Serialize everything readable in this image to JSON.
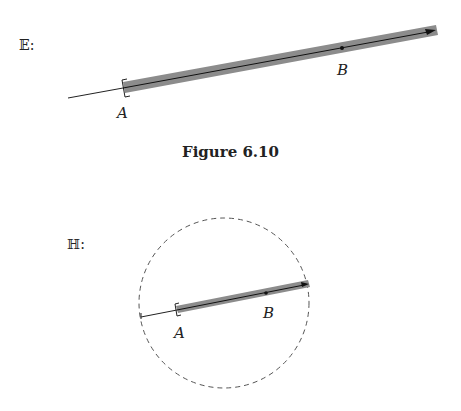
{
  "figure_top": {
    "space_label": "𝔼:",
    "point_a_label": "A",
    "point_b_label": "B",
    "band_color": "#8c8c8c",
    "line_color": "#111111"
  },
  "caption": "Figure 6.10",
  "figure_bottom": {
    "space_label": "ℍ:",
    "point_a_label": "A",
    "point_b_label": "B",
    "band_color": "#8c8c8c",
    "circle_style": "dashed"
  }
}
